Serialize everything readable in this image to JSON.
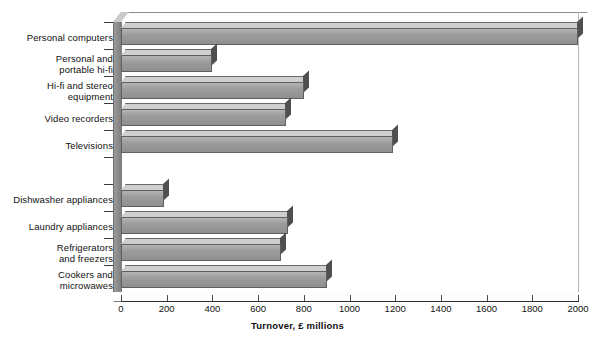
{
  "chart_data": {
    "type": "bar",
    "orientation": "horizontal",
    "title": "",
    "xlabel": "Turnover, £ millions",
    "ylabel": "",
    "xlim": [
      0,
      2000
    ],
    "xticks": [
      0,
      200,
      400,
      600,
      800,
      1000,
      1200,
      1400,
      1600,
      1800,
      2000
    ],
    "grid": false,
    "legend": null,
    "style": "3d-bar",
    "bar_color": "#9d9d9d",
    "categories": [
      "Personal computers",
      "Personal and\nportable hi-fi",
      "Hi-fi and stereo\nequipment",
      "Video recorders",
      "Televisions",
      "",
      "Dishwasher appliances",
      "Laundry appliances",
      "Refrigerators\nand freezers",
      "Cookers and\nmicrowawes"
    ],
    "values": [
      2000,
      400,
      800,
      720,
      1190,
      null,
      190,
      730,
      700,
      900
    ]
  },
  "axis": {
    "x_title": "Turnover, £ millions",
    "tick_labels": [
      "0",
      "200",
      "400",
      "600",
      "800",
      "1000",
      "1200",
      "1400",
      "1600",
      "1800",
      "2000"
    ]
  },
  "categories": [
    {
      "line1": "Personal computers",
      "line2": ""
    },
    {
      "line1": "Personal and",
      "line2": "portable hi-fi"
    },
    {
      "line1": "Hi-fi and stereo",
      "line2": "equipment"
    },
    {
      "line1": "Video recorders",
      "line2": ""
    },
    {
      "line1": "Televisions",
      "line2": ""
    },
    {
      "line1": "",
      "line2": ""
    },
    {
      "line1": "Dishwasher appliances",
      "line2": ""
    },
    {
      "line1": "Laundry appliances",
      "line2": ""
    },
    {
      "line1": "Refrigerators",
      "line2": "and freezers"
    },
    {
      "line1": "Cookers and",
      "line2": "microwawes"
    }
  ]
}
